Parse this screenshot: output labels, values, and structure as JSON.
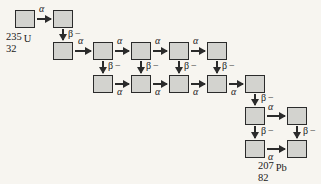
{
  "diagram": {
    "colors": {
      "background": "#f7f5f0",
      "box_fill": "#d3d3cf",
      "box_border": "#2b2b2b",
      "arrow": "#2b2b2b",
      "text": "#1a1a1a"
    },
    "start_nuclide": {
      "mass_number": "235",
      "atomic_number": "32",
      "symbol": "U"
    },
    "end_nuclide": {
      "mass_number": "207",
      "atomic_number": "82",
      "symbol": "Pb"
    },
    "decay_types": {
      "alpha": "α",
      "beta_minus": "β −"
    },
    "boxes": [
      {
        "id": "b1",
        "x": 15,
        "y": 10
      },
      {
        "id": "b2",
        "x": 53,
        "y": 10
      },
      {
        "id": "b3",
        "x": 53,
        "y": 42
      },
      {
        "id": "b4",
        "x": 93,
        "y": 42
      },
      {
        "id": "b5",
        "x": 131,
        "y": 42
      },
      {
        "id": "b6",
        "x": 169,
        "y": 42
      },
      {
        "id": "b7",
        "x": 207,
        "y": 42
      },
      {
        "id": "b8",
        "x": 93,
        "y": 75
      },
      {
        "id": "b9",
        "x": 131,
        "y": 75
      },
      {
        "id": "b10",
        "x": 169,
        "y": 75
      },
      {
        "id": "b11",
        "x": 207,
        "y": 75
      },
      {
        "id": "b12",
        "x": 245,
        "y": 75
      },
      {
        "id": "b13",
        "x": 245,
        "y": 107
      },
      {
        "id": "b14",
        "x": 287,
        "y": 107
      },
      {
        "id": "b15",
        "x": 245,
        "y": 140
      },
      {
        "id": "b16",
        "x": 287,
        "y": 140
      }
    ],
    "alpha_arrows": [
      {
        "x": 37,
        "y": 18,
        "w": 14
      },
      {
        "x": 75,
        "y": 50,
        "w": 16
      },
      {
        "x": 115,
        "y": 50,
        "w": 14
      },
      {
        "x": 153,
        "y": 50,
        "w": 14
      },
      {
        "x": 191,
        "y": 50,
        "w": 14
      },
      {
        "x": 115,
        "y": 83,
        "w": 14
      },
      {
        "x": 153,
        "y": 83,
        "w": 14
      },
      {
        "x": 191,
        "y": 83,
        "w": 14
      },
      {
        "x": 229,
        "y": 83,
        "w": 14
      },
      {
        "x": 267,
        "y": 115,
        "w": 18
      },
      {
        "x": 267,
        "y": 148,
        "w": 18
      }
    ],
    "beta_arrows": [
      {
        "x": 62,
        "y": 29,
        "h": 11
      },
      {
        "x": 102,
        "y": 61,
        "h": 12
      },
      {
        "x": 140,
        "y": 61,
        "h": 12
      },
      {
        "x": 178,
        "y": 61,
        "h": 12
      },
      {
        "x": 216,
        "y": 61,
        "h": 12
      },
      {
        "x": 254,
        "y": 94,
        "h": 11
      },
      {
        "x": 254,
        "y": 126,
        "h": 12
      },
      {
        "x": 296,
        "y": 126,
        "h": 12
      }
    ],
    "alpha_labels": [
      {
        "x": 39,
        "y": 3
      },
      {
        "x": 78,
        "y": 35
      },
      {
        "x": 117,
        "y": 35
      },
      {
        "x": 155,
        "y": 35
      },
      {
        "x": 193,
        "y": 35
      },
      {
        "x": 117,
        "y": 86
      },
      {
        "x": 155,
        "y": 86
      },
      {
        "x": 193,
        "y": 86
      },
      {
        "x": 231,
        "y": 86
      },
      {
        "x": 268,
        "y": 101
      },
      {
        "x": 268,
        "y": 151
      }
    ],
    "beta_labels": [
      {
        "x": 68,
        "y": 28
      },
      {
        "x": 108,
        "y": 60
      },
      {
        "x": 146,
        "y": 60
      },
      {
        "x": 184,
        "y": 60
      },
      {
        "x": 222,
        "y": 60
      },
      {
        "x": 261,
        "y": 92
      },
      {
        "x": 261,
        "y": 125
      },
      {
        "x": 303,
        "y": 125
      }
    ],
    "start_label_pos": {
      "x": 6,
      "y": 31
    },
    "end_label_pos": {
      "x": 258,
      "y": 160
    }
  }
}
